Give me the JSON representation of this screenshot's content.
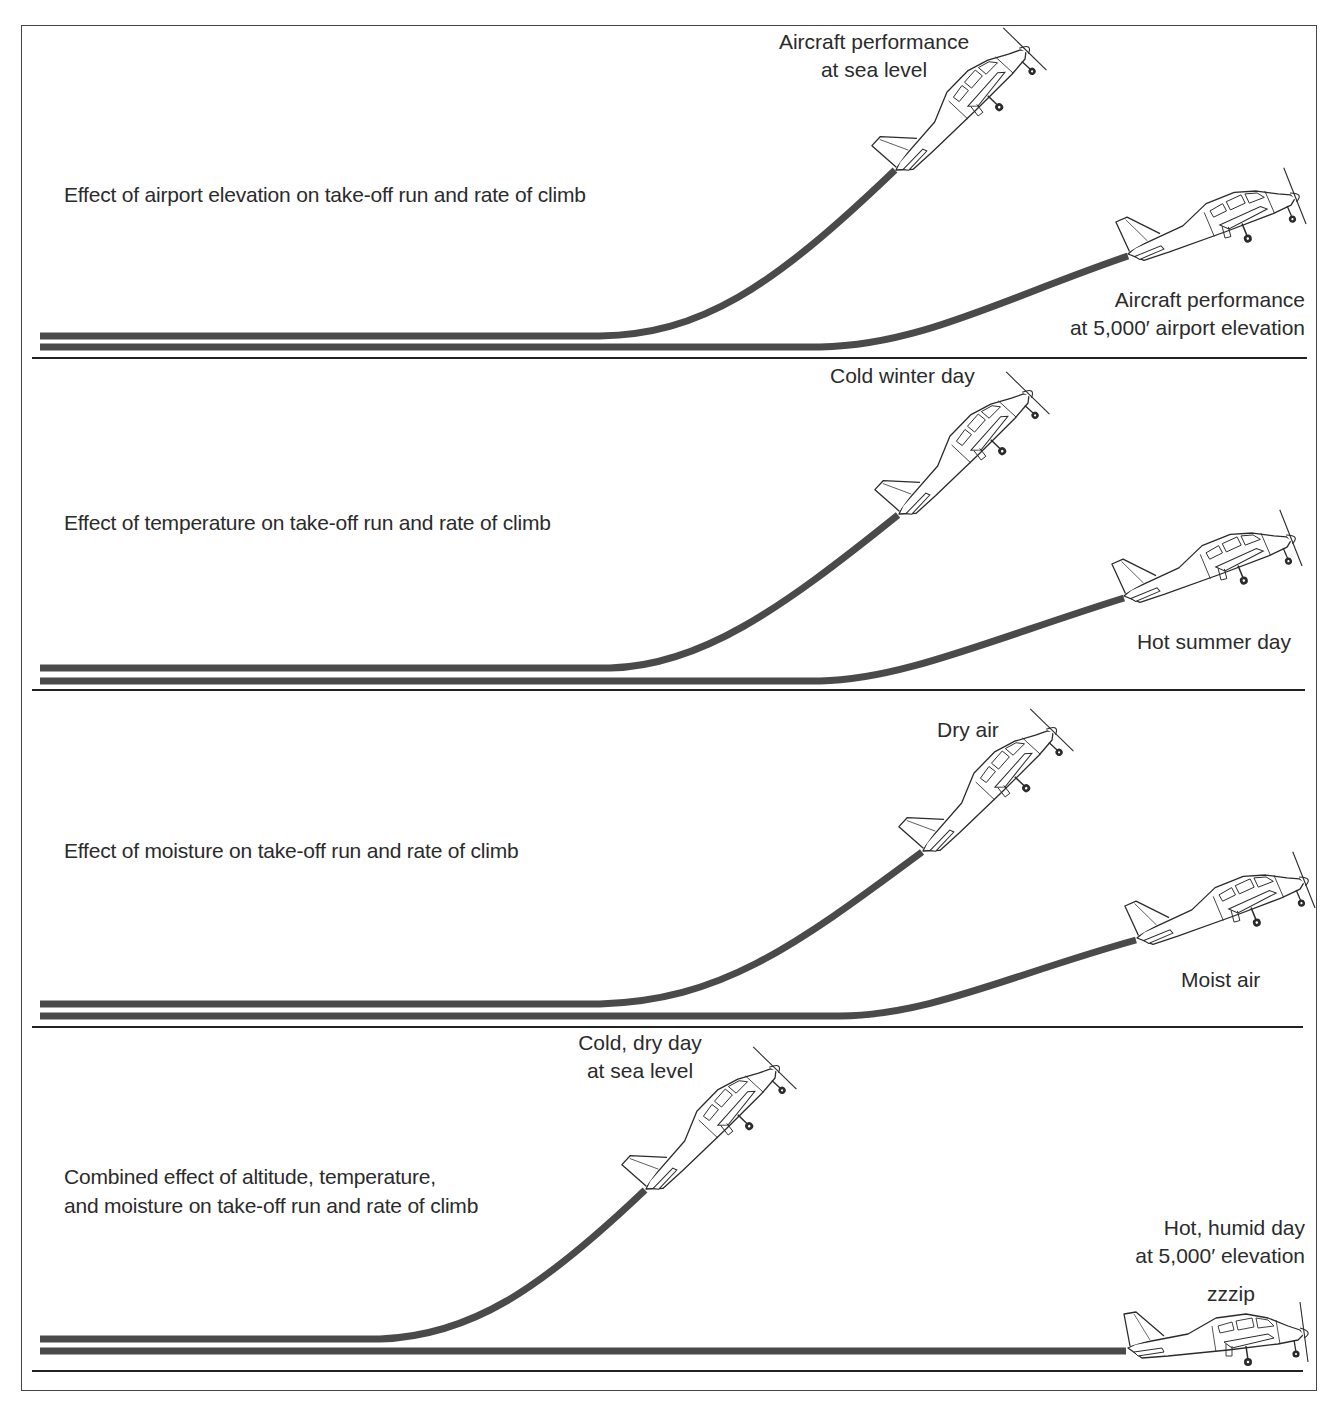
{
  "page": {
    "header_fragment": "60 Take-Off"
  },
  "colors": {
    "ink": "#2b2b2b",
    "trail": "#4a4a4a",
    "ground": "#222222",
    "paper": "#ffffff"
  },
  "panels": [
    {
      "id": "elevation",
      "caption": "Effect of airport elevation on take-off run and rate of climb",
      "good_label": "Aircraft performance\nat sea level",
      "bad_label": "Aircraft performance\nat 5,000′ airport elevation"
    },
    {
      "id": "temperature",
      "caption": "Effect of temperature on take-off run and rate of climb",
      "good_label": "Cold winter day",
      "bad_label": "Hot summer day"
    },
    {
      "id": "moisture",
      "caption": "Effect of moisture on take-off run and rate of climb",
      "good_label": "Dry air",
      "bad_label": "Moist air"
    },
    {
      "id": "combined",
      "caption": "Combined effect of altitude, temperature,\nand moisture on take-off run and rate of climb",
      "good_label": "Cold, dry day\nat sea level",
      "bad_label": "Hot, humid day\nat 5,000′ elevation",
      "sound_effect": "zzzip"
    }
  ]
}
